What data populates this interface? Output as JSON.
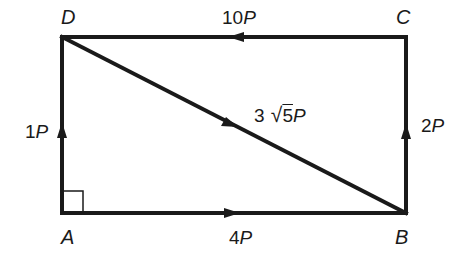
{
  "diagram": {
    "type": "force-rectangle",
    "vertices": {
      "A": {
        "label": "A",
        "x": 62,
        "y": 213
      },
      "B": {
        "label": "B",
        "x": 406,
        "y": 213
      },
      "C": {
        "label": "C",
        "x": 406,
        "y": 37
      },
      "D": {
        "label": "D",
        "x": 62,
        "y": 37
      }
    },
    "forces": [
      {
        "from": "A",
        "to": "D",
        "magnitude_num": "1",
        "unit": "P",
        "label": "1P",
        "direction": "up"
      },
      {
        "from": "A",
        "to": "B",
        "magnitude_num": "4",
        "unit": "P",
        "label": "4P",
        "direction": "right"
      },
      {
        "from": "B",
        "to": "C",
        "magnitude_num": "2",
        "unit": "P",
        "label": "2P",
        "direction": "up"
      },
      {
        "from": "C",
        "to": "D",
        "magnitude_num": "10",
        "unit": "P",
        "label": "10P",
        "direction": "left"
      },
      {
        "from": "D",
        "to": "B",
        "magnitude_num": "3",
        "radical": "5",
        "unit": "P",
        "label": "3√5P",
        "direction": "diagonal-down-right"
      }
    ],
    "right_angle_marker": "A",
    "line_color": "#1a1a1a"
  }
}
